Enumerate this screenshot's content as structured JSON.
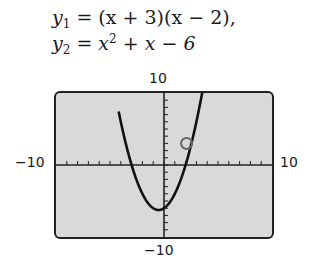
{
  "equations": {
    "y1": {
      "lhs": "y",
      "sub": "1",
      "rhs": " = (x + 3)(x − 2),"
    },
    "y2": {
      "lhs": "y",
      "sub": "2",
      "rhs_a": " = x",
      "sup": "2",
      "rhs_b": " + x − 6"
    }
  },
  "window_labels": {
    "ymax": "10",
    "ymin": "−10",
    "xmin": "−10",
    "xmax": "10"
  },
  "chart_data": {
    "type": "line",
    "title": "",
    "series": [
      {
        "name": "y1 = (x + 3)(x - 2)",
        "function": "(x+3)*(x-2)"
      },
      {
        "name": "y2 = x^2 + x - 6",
        "function": "x^2+x-6"
      }
    ],
    "x": [
      -4.0,
      -3.5,
      -3,
      -2,
      -1,
      -0.5,
      0,
      1,
      2,
      3,
      3.5,
      4.0
    ],
    "values": [
      6,
      3.75,
      0,
      -4,
      -6,
      -6.25,
      -6,
      -4,
      0,
      6,
      9.75,
      14
    ],
    "xlim": [
      -10,
      10
    ],
    "ylim": [
      -10,
      10
    ],
    "xscl": 1,
    "yscl": 1,
    "grid": false,
    "annotations": [
      {
        "type": "open-circle",
        "x": 2,
        "y": 3
      }
    ],
    "colors": {
      "screen": "#d9d9d9",
      "curve": "#111111",
      "marker": "#666666"
    }
  }
}
